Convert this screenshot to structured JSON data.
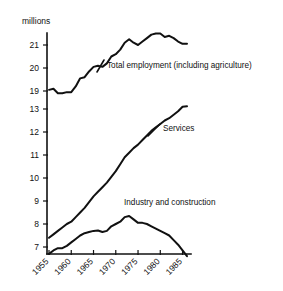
{
  "axis": {
    "unit_label": "millions",
    "y_ticks_upper": [
      "21",
      "20",
      "19"
    ],
    "y_ticks_lower": [
      "13",
      "12",
      "11",
      "10",
      "9",
      "8",
      "7"
    ],
    "x_ticks": [
      "1955",
      "1960",
      "1965",
      "1970",
      "1975",
      "1980",
      "1985"
    ],
    "broken_axis": true
  },
  "series_labels": {
    "total": "Total employment (including agriculture)",
    "services": "Services",
    "industry": "Industry and construction"
  },
  "top_fragment": "",
  "colors": {
    "ink": "#111111",
    "background": "#ffffff"
  },
  "chart_data": {
    "type": "line",
    "title": "",
    "xlabel": "",
    "ylabel": "millions",
    "ylim": [
      7,
      13,
      19,
      21.6
    ],
    "xlim": [
      1955,
      1986
    ],
    "grid": false,
    "legend": "inline-annotations",
    "axis_note": "Broken y-axis: lower segment 7-13 millions, upper segment 19-21.6 millions",
    "x": [
      1955,
      1956,
      1957,
      1958,
      1959,
      1960,
      1961,
      1962,
      1963,
      1964,
      1965,
      1966,
      1967,
      1968,
      1969,
      1970,
      1971,
      1972,
      1973,
      1974,
      1975,
      1976,
      1977,
      1978,
      1979,
      1980,
      1981,
      1982,
      1983,
      1984,
      1985,
      1986
    ],
    "series": [
      {
        "name": "Total employment (including agriculture)",
        "values": [
          19.05,
          19.1,
          18.9,
          18.9,
          18.95,
          18.95,
          19.2,
          19.55,
          19.6,
          19.85,
          20.05,
          20.1,
          20.05,
          20.2,
          20.5,
          20.6,
          20.8,
          21.1,
          21.25,
          21.1,
          21.0,
          21.15,
          21.3,
          21.45,
          21.5,
          21.5,
          21.35,
          21.4,
          21.3,
          21.15,
          21.05,
          21.05
        ]
      },
      {
        "name": "Services",
        "values": [
          7.4,
          7.55,
          7.7,
          7.85,
          8.0,
          8.1,
          8.3,
          8.5,
          8.7,
          8.95,
          9.2,
          9.4,
          9.6,
          9.8,
          10.05,
          10.3,
          10.6,
          10.9,
          11.1,
          11.3,
          11.45,
          11.65,
          11.85,
          12.05,
          12.2,
          12.35,
          12.5,
          12.6,
          12.75,
          12.9,
          13.1,
          13.12
        ]
      },
      {
        "name": "Industry and construction",
        "values": [
          6.7,
          6.85,
          6.95,
          6.95,
          7.05,
          7.2,
          7.35,
          7.5,
          7.6,
          7.65,
          7.7,
          7.72,
          7.65,
          7.7,
          7.9,
          8.0,
          8.1,
          8.3,
          8.35,
          8.2,
          8.05,
          8.05,
          8.0,
          7.9,
          7.8,
          7.7,
          7.6,
          7.5,
          7.3,
          7.1,
          6.85,
          6.6
        ]
      }
    ]
  }
}
